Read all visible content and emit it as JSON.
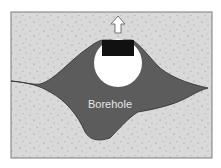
{
  "diagram": {
    "label": "Borehole",
    "colors": {
      "background": "#ffffff",
      "rock": "#d9d9d9",
      "speckle": "#8a8a8a",
      "borehole": "#5c5c5c",
      "borehole_edge": "#2e2e2e",
      "cavity": "#ffffff",
      "block": "#111111",
      "label_text": "#e6e6e6",
      "frame": "#7a7a7a"
    },
    "elements": [
      "rock-background",
      "borehole-region",
      "cavity-circle",
      "black-block",
      "upward-arrow"
    ]
  }
}
